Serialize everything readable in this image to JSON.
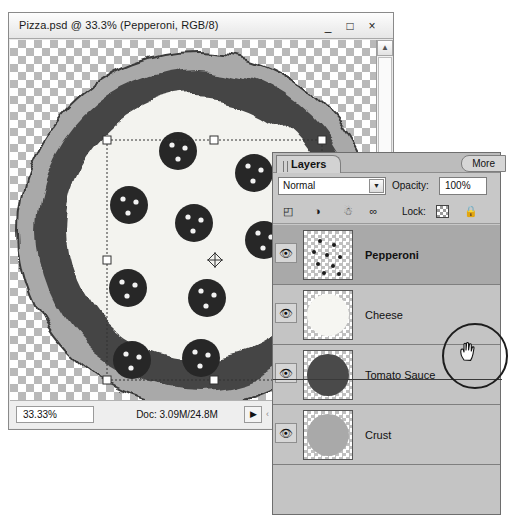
{
  "window": {
    "title": "Pizza.psd @ 33.3% (Pepperoni, RGB/8)",
    "minimize_label": "_",
    "maximize_label": "□",
    "close_label": "×"
  },
  "status_bar": {
    "zoom": "33.33%",
    "doc_info": "Doc: 3.09M/24.8M",
    "arrow_label": "▶",
    "grip_label": "‹"
  },
  "scrollbar": {
    "up_arrow": "▲",
    "down_arrow": "▼"
  },
  "layers_panel": {
    "tab_label": "Layers",
    "more_label": "More",
    "blend_mode": "Normal",
    "blend_mode_arrow": "▼",
    "opacity_label": "Opacity:",
    "opacity_value": "100%",
    "lock_label": "Lock:",
    "lock_transparent_icon": "checkerboard-icon",
    "lock_all_icon": "🔒",
    "toolbar_icons": {
      "new_fill_layer": "◰",
      "adjustment_layer": "◑",
      "delete_layer": "☃",
      "link_layers": "∞"
    },
    "eye_icon": "👁",
    "layers": [
      {
        "name": "Pepperoni",
        "selected": true,
        "visible": true,
        "thumb": "pepperoni"
      },
      {
        "name": "Cheese",
        "selected": false,
        "visible": true,
        "thumb": "cheese"
      },
      {
        "name": "Tomato Sauce",
        "selected": false,
        "visible": true,
        "thumb": "sauce"
      },
      {
        "name": "Crust",
        "selected": false,
        "visible": true,
        "thumb": "crust"
      }
    ]
  },
  "canvas": {
    "description": "pizza-artwork-with-transform-selection",
    "colors": {
      "crust_outer": "#a8a8a8",
      "sauce": "#4a4a4a",
      "cheese": "#f2f2ee",
      "pepperoni": "#2b2b2b",
      "checker_dark": "#b9b9b9",
      "checker_light": "#ffffff"
    }
  },
  "annotation": {
    "cursor": "hand-cursor",
    "highlight": "circle-callout"
  }
}
